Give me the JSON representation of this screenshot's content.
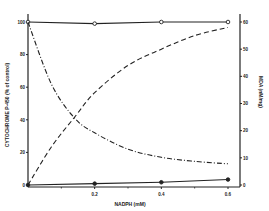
{
  "chart_data": {
    "type": "line",
    "title": "",
    "xlabel": "NADPH (mM)",
    "ylabel": "CYTOCHROME P-450 (% of control)",
    "y2label": "MDA (nM/mg)",
    "xlim": [
      0,
      0.6
    ],
    "ylim": [
      0,
      100
    ],
    "y2lim": [
      0,
      60
    ],
    "x_ticks": [
      "0.2",
      "0.4",
      "0.6"
    ],
    "y_ticks": [
      "0",
      "20",
      "40",
      "60",
      "80",
      "100"
    ],
    "y2_ticks": [
      "0",
      "10",
      "20",
      "30",
      "40",
      "50",
      "60"
    ],
    "grid": false,
    "legend": "none",
    "x": [
      0,
      0.2,
      0.4,
      0.6
    ],
    "series": [
      {
        "name": "Cytochrome P-450 (open circles)",
        "axis": "left",
        "style": "solid",
        "marker": "open-circle",
        "values": [
          100,
          99,
          100,
          100
        ]
      },
      {
        "name": "MDA (filled circles)",
        "axis": "right",
        "style": "solid",
        "marker": "filled-circle",
        "values": [
          0,
          0.5,
          1,
          2
        ]
      },
      {
        "name": "Dashed curve",
        "axis": "right",
        "style": "dashed",
        "marker": "none",
        "values": [
          0,
          34,
          50,
          58
        ]
      },
      {
        "name": "Dash-dot curve",
        "axis": "left",
        "style": "dash-dot",
        "marker": "none",
        "values": [
          100,
          32,
          17,
          13
        ]
      }
    ]
  }
}
